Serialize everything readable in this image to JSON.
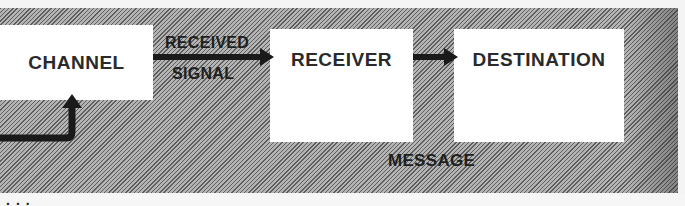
{
  "diagram": {
    "nodes": [
      {
        "id": "channel",
        "label": "CHANNEL"
      },
      {
        "id": "receiver",
        "label": "RECEIVER"
      },
      {
        "id": "destination",
        "label": "DESTINATION"
      }
    ],
    "edges": [
      {
        "from": "channel",
        "to": "receiver",
        "label_top": "RECEIVED",
        "label_bottom": "SIGNAL"
      },
      {
        "from": "receiver",
        "to": "destination",
        "label": "MESSAGE"
      },
      {
        "from": "offscreen-left",
        "to": "channel",
        "label": ""
      }
    ],
    "bottom_caption_fragment": "...",
    "colors": {
      "background_hatch_dark": "#5e5e5e",
      "background_hatch_light": "#b4b4b4",
      "box_fill": "#ffffff",
      "arrow": "#1a1a1a",
      "text": "#2a2a2a"
    }
  }
}
